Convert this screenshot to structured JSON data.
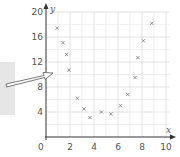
{
  "chart_data": {
    "type": "scatter",
    "title": "",
    "xlabel": "x",
    "ylabel": "y",
    "xlim": [
      0,
      10
    ],
    "ylim": [
      0,
      20
    ],
    "grid": true,
    "marker": "x",
    "x_ticks": [
      "0",
      "2",
      "4",
      "6",
      "8",
      "10"
    ],
    "y_ticks": [
      "4",
      "8",
      "12",
      "16",
      "20"
    ],
    "series": [
      {
        "name": "points",
        "points": [
          [
            1.0,
            17.4
          ],
          [
            1.5,
            15.1
          ],
          [
            1.8,
            13.2
          ],
          [
            2.0,
            10.7
          ],
          [
            2.7,
            6.2
          ],
          [
            3.25,
            4.5
          ],
          [
            3.75,
            3.1
          ],
          [
            4.7,
            4.0
          ],
          [
            5.5,
            3.7
          ],
          [
            6.3,
            5.0
          ],
          [
            6.9,
            6.8
          ],
          [
            7.5,
            9.5
          ],
          [
            7.75,
            12.7
          ],
          [
            8.2,
            15.4
          ],
          [
            8.9,
            18.2
          ]
        ]
      }
    ],
    "annotations": [
      {
        "type": "arrow",
        "style": "hollow",
        "points_to": [
          0,
          10.3
        ],
        "from_left_panel": true
      }
    ]
  },
  "labels": {
    "x_axis": "x",
    "y_axis": "y",
    "origin": "0"
  }
}
